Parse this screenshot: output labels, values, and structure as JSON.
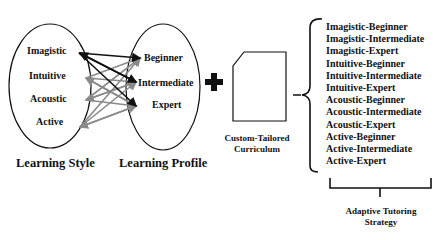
{
  "figure": {
    "top_caption_cut": "Figure: Learning style and learning profile mapping",
    "learning_style": {
      "title": "Learning Style",
      "items": [
        "Imagistic",
        "Intuitive",
        "Acoustic",
        "Active"
      ]
    },
    "learning_profile": {
      "title": "Learning Profile",
      "items": [
        "Beginner",
        "Intermediate",
        "Expert"
      ]
    },
    "curriculum": {
      "line1": "Custom-Tailored",
      "line2": "Curriculum"
    },
    "strategies": {
      "items": [
        "Imagistic-Beginner",
        "Imagistic-Intermediate",
        "Imagistic-Expert",
        "Intuitive-Beginner",
        "Intuitive-Intermediate",
        "Intuitive-Expert",
        "Acoustic-Beginner",
        "Acoustic-Intermediate",
        "Acoustic-Expert",
        "Active-Beginner",
        "Active-Intermediate",
        "Active-Expert"
      ],
      "title_line1": "Adaptive Tutoring",
      "title_line2": "Strategy"
    },
    "colors": {
      "primary_arrow": "#111111",
      "secondary_arrow": "#8a8a8a"
    }
  }
}
